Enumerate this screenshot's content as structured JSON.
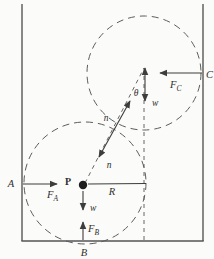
{
  "diagram": {
    "type": "physics-free-body-diagram",
    "labels": {
      "point_A": "A",
      "point_B": "B",
      "point_C": "C",
      "center_P": "P",
      "force_A": {
        "symbol": "F",
        "subscript": "A"
      },
      "force_B": {
        "symbol": "F",
        "subscript": "B"
      },
      "force_C": {
        "symbol": "F",
        "subscript": "C"
      },
      "normal_upper": "n",
      "normal_lower": "n",
      "weight_upper": "w",
      "weight_lower": "w",
      "radius": "R",
      "angle": "θ"
    },
    "colors": {
      "background": "#fbfbf9",
      "line": "#3d3d3d",
      "dashed": "#555555"
    }
  }
}
